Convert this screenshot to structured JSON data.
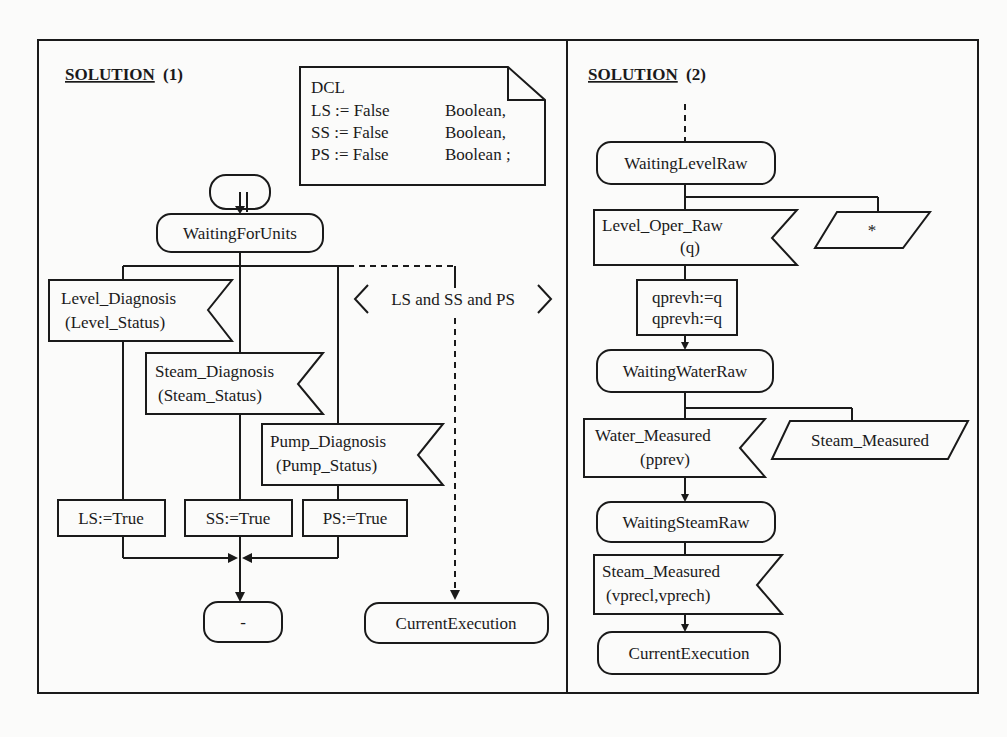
{
  "panels": [
    {
      "title": "SOLUTION",
      "title_suffix": "(1)",
      "declaration": {
        "header": "DCL",
        "lines": [
          {
            "var": "LS := False",
            "type": "Boolean,"
          },
          {
            "var": "SS := False",
            "type": "Boolean,"
          },
          {
            "var": "PS := False",
            "type": "Boolean ;"
          }
        ]
      },
      "start_state": "",
      "state_waiting": "WaitingForUnits",
      "inputs": [
        {
          "line1": "Level_Diagnosis",
          "line2": "(Level_Status)"
        },
        {
          "line1": "Steam_Diagnosis",
          "line2": "(Steam_Status)"
        },
        {
          "line1": "Pump_Diagnosis",
          "line2": "(Pump_Status)"
        }
      ],
      "tasks": [
        "LS:=True",
        "SS:=True",
        "PS:=True"
      ],
      "continuous_signal": "LS and SS and PS",
      "end_state": "-",
      "next_state": "CurrentExecution"
    },
    {
      "title": "SOLUTION",
      "title_suffix": "(2)",
      "state1": "WaitingLevelRaw",
      "input1": {
        "line1": "Level_Oper_Raw",
        "line2": "(q)"
      },
      "save1": "*",
      "task1": {
        "line1": "qprevh:=q",
        "line2": "qprevh:=q"
      },
      "state2": "WaitingWaterRaw",
      "input2": {
        "line1": "Water_Measured",
        "line2": "(pprev)"
      },
      "save2": "Steam_Measured",
      "state3": "WaitingSteamRaw",
      "input3": {
        "line1": "Steam_Measured",
        "line2": "(vprecl,vprech)"
      },
      "state4": "CurrentExecution"
    }
  ]
}
